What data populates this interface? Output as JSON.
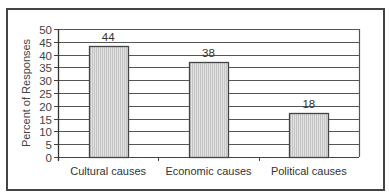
{
  "chart_data": {
    "type": "bar",
    "title": "",
    "xlabel": "",
    "ylabel": "Percent of Responses",
    "categories": [
      "Cultural causes",
      "Economic causes",
      "Political causes"
    ],
    "values": [
      44,
      38,
      18
    ],
    "data_labels": [
      "44",
      "38",
      "18"
    ],
    "ylim": [
      0,
      50
    ],
    "yticks": [
      0,
      5,
      10,
      15,
      20,
      25,
      30,
      35,
      40,
      45,
      50
    ],
    "grid": "horizontal",
    "legend": "none",
    "bar_fill": "#d6d6d6",
    "bar_edge": "#444444"
  }
}
